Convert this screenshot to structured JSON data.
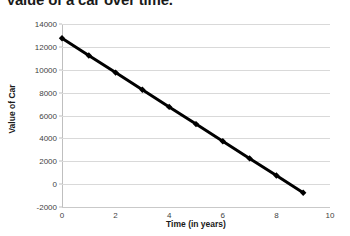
{
  "chart_data": {
    "type": "line",
    "title": "Value of a car over time.",
    "xlabel": "Time (in years)",
    "ylabel": "Value of Car",
    "x": [
      0,
      1,
      2,
      3,
      4,
      5,
      6,
      7,
      8,
      9
    ],
    "values": [
      12750,
      11250,
      9750,
      8250,
      6750,
      5250,
      3750,
      2250,
      750,
      -750
    ],
    "series": [
      {
        "name": "Value of Car",
        "values": [
          12750,
          11250,
          9750,
          8250,
          6750,
          5250,
          3750,
          2250,
          750,
          -750
        ]
      }
    ],
    "xlim": [
      0,
      10
    ],
    "ylim": [
      -2000,
      14000
    ],
    "xticks": [
      0,
      2,
      4,
      6,
      8,
      10
    ],
    "yticks": [
      -2000,
      0,
      2000,
      4000,
      6000,
      8000,
      10000,
      12000,
      14000
    ],
    "xtick_labels": [
      "0",
      "2",
      "4",
      "6",
      "8",
      "10"
    ],
    "ytick_labels": [
      "-2000",
      "0",
      "2000",
      "4000",
      "6000",
      "8000",
      "10000",
      "12000",
      "14000"
    ],
    "grid": true,
    "grid_axis": "y",
    "legend": false,
    "legend_position": "none",
    "marker": "diamond",
    "line_color": "#000000",
    "marker_color": "#000000",
    "grid_color": "#d9d9d9",
    "background_color": "#ffffff"
  }
}
